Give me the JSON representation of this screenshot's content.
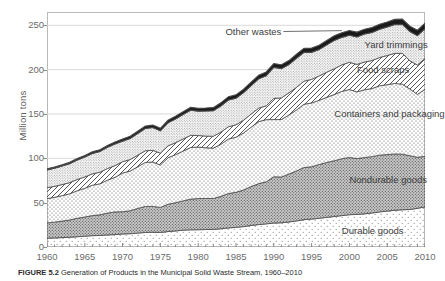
{
  "figure": {
    "caption_label": "FIGURE 5.2",
    "caption_text": "Generation of Products in the Municipal Solid Waste Stream, 1960–2010"
  },
  "chart_data": {
    "type": "area",
    "stacked": true,
    "title": "",
    "xlabel": "",
    "ylabel": "Million tons",
    "xlim": [
      1960,
      2010
    ],
    "ylim": [
      0,
      265
    ],
    "yticks": [
      0,
      50,
      100,
      150,
      200,
      250
    ],
    "xticks": [
      1960,
      1965,
      1970,
      1975,
      1980,
      1985,
      1990,
      1995,
      2000,
      2005,
      2010
    ],
    "grid": "horizontal",
    "legend_position": "in-plot-labels",
    "x": [
      1960,
      1961,
      1962,
      1963,
      1964,
      1965,
      1966,
      1967,
      1968,
      1969,
      1970,
      1971,
      1972,
      1973,
      1974,
      1975,
      1976,
      1977,
      1978,
      1979,
      1980,
      1981,
      1982,
      1983,
      1984,
      1985,
      1986,
      1987,
      1988,
      1989,
      1990,
      1991,
      1992,
      1993,
      1994,
      1995,
      1996,
      1997,
      1998,
      1999,
      2000,
      2001,
      2002,
      2003,
      2004,
      2005,
      2006,
      2007,
      2008,
      2009,
      2010
    ],
    "series": [
      {
        "name": "Durable goods",
        "pattern": "sparse-dots",
        "color": "#ffffff",
        "label_x_year": 1999,
        "label_y_value": 18,
        "values": [
          9.9,
          10.2,
          10.6,
          11.0,
          11.6,
          12.2,
          12.8,
          13.0,
          13.6,
          14.0,
          14.7,
          15.0,
          15.7,
          16.4,
          16.6,
          16.4,
          17.4,
          18.1,
          19.0,
          19.4,
          19.5,
          19.7,
          19.8,
          20.6,
          21.5,
          22.2,
          23.0,
          24.2,
          25.3,
          26.1,
          27.0,
          27.3,
          28.2,
          29.4,
          30.8,
          31.5,
          32.4,
          33.4,
          34.4,
          35.4,
          36.4,
          36.8,
          37.4,
          38.4,
          39.6,
          40.5,
          41.4,
          42.0,
          42.3,
          43.6,
          45.3
        ]
      },
      {
        "name": "Nondurable goods",
        "pattern": "dense-dots-gray",
        "color": "#cfcfcf",
        "label_x_year": 2000,
        "label_y_value": 76,
        "values": [
          17.3,
          17.8,
          18.6,
          19.4,
          20.8,
          21.6,
          22.6,
          23.3,
          24.6,
          25.6,
          25.1,
          25.9,
          27.8,
          29.3,
          29.2,
          28.2,
          30.8,
          31.8,
          33.0,
          34.6,
          35.1,
          35.0,
          34.9,
          36.5,
          38.8,
          39.5,
          41.3,
          43.9,
          46.2,
          47.4,
          52.2,
          51.6,
          54.1,
          56.4,
          58.8,
          59.0,
          60.6,
          61.9,
          62.9,
          64.1,
          64.6,
          62.9,
          63.5,
          63.5,
          64.0,
          63.7,
          63.5,
          62.7,
          60.6,
          57.6,
          56.9
        ]
      },
      {
        "name": "Containers and packaging",
        "pattern": "medium-dots",
        "color": "#ffffff",
        "label_x_year": 1998,
        "label_y_value": 150,
        "values": [
          27.4,
          28.0,
          28.7,
          29.6,
          31.1,
          32.4,
          34.2,
          35.0,
          37.2,
          39.0,
          43.6,
          44.8,
          47.0,
          49.7,
          50.0,
          47.9,
          52.4,
          54.2,
          56.2,
          58.2,
          58.1,
          57.2,
          56.8,
          58.8,
          61.5,
          62.1,
          64.3,
          67.0,
          69.9,
          70.1,
          64.5,
          64.8,
          66.6,
          68.7,
          71.4,
          71.9,
          72.4,
          73.5,
          74.6,
          76.0,
          76.6,
          75.2,
          76.4,
          76.8,
          78.2,
          78.8,
          79.6,
          78.9,
          75.3,
          70.9,
          75.7
        ]
      },
      {
        "name": "Food scraps",
        "pattern": "diagonal-hatch",
        "color": "#ffffff",
        "label_x_year": 2001,
        "label_y_value": 200,
        "values": [
          12.2,
          12.4,
          12.5,
          12.6,
          12.7,
          12.8,
          12.9,
          13.0,
          13.1,
          13.2,
          12.8,
          12.9,
          13.0,
          13.1,
          13.2,
          13.3,
          13.4,
          13.5,
          13.6,
          13.7,
          13.0,
          13.2,
          13.4,
          13.6,
          13.8,
          14.0,
          14.4,
          14.8,
          15.2,
          15.6,
          23.9,
          24.4,
          25.0,
          25.5,
          26.0,
          26.6,
          27.5,
          28.3,
          29.1,
          29.9,
          30.7,
          31.0,
          31.3,
          31.6,
          31.9,
          32.9,
          33.9,
          34.8,
          31.8,
          33.0,
          34.8
        ]
      },
      {
        "name": "Yard trimmings",
        "pattern": "fine-dots",
        "color": "#ffffff",
        "label_x_year": 2002,
        "label_y_value": 228,
        "values": [
          20.0,
          20.4,
          20.9,
          21.4,
          21.9,
          22.4,
          22.9,
          23.4,
          23.9,
          24.4,
          23.2,
          23.8,
          24.5,
          25.2,
          25.8,
          25.2,
          26.0,
          26.8,
          27.6,
          28.4,
          27.5,
          28.2,
          28.8,
          29.5,
          30.2,
          30.0,
          31.0,
          32.0,
          33.0,
          34.0,
          35.0,
          33.0,
          31.8,
          32.8,
          32.5,
          30.5,
          29.8,
          30.8,
          32.0,
          31.0,
          30.5,
          31.0,
          31.5,
          31.6,
          31.8,
          32.1,
          32.4,
          32.6,
          32.9,
          33.2,
          33.4
        ]
      },
      {
        "name": "Other wastes",
        "pattern": "solid-black",
        "color": "#1a1a1a",
        "label_x_year": 1991,
        "label_y_value": 243,
        "values": [
          1.3,
          1.4,
          1.5,
          1.6,
          1.7,
          1.8,
          1.9,
          2.0,
          2.1,
          2.2,
          2.3,
          2.4,
          2.5,
          2.6,
          2.7,
          2.8,
          2.9,
          3.0,
          3.1,
          3.2,
          3.3,
          3.4,
          3.5,
          3.6,
          3.7,
          3.8,
          3.9,
          4.0,
          4.1,
          4.2,
          4.3,
          4.4,
          4.5,
          4.6,
          4.7,
          4.8,
          4.9,
          5.0,
          5.1,
          5.2,
          5.3,
          5.4,
          5.5,
          5.6,
          5.7,
          5.8,
          5.9,
          6.0,
          6.1,
          6.2,
          6.3
        ]
      }
    ],
    "totals": [
      88.1,
      90.2,
      92.8,
      95.6,
      99.8,
      103.2,
      107.3,
      109.7,
      114.5,
      118.4,
      121.7,
      124.8,
      130.5,
      136.3,
      137.5,
      133.8,
      142.9,
      147.4,
      152.5,
      157.5,
      156.5,
      156.7,
      157.2,
      162.6,
      169.5,
      171.6,
      177.9,
      185.9,
      193.7,
      197.4,
      206.9,
      205.5,
      210.2,
      217.4,
      224.2,
      224.3,
      227.6,
      232.9,
      238.1,
      241.6,
      244.1,
      242.3,
      245.6,
      247.5,
      251.2,
      253.8,
      256.7,
      257.0,
      249.0,
      244.5,
      252.4
    ]
  },
  "axis_labels": {
    "y_title": "Million tons",
    "y_ticks": [
      "0",
      "50",
      "100",
      "150",
      "200",
      "250"
    ],
    "x_ticks": [
      "1960",
      "1965",
      "1970",
      "1975",
      "1980",
      "1985",
      "1990",
      "1995",
      "2000",
      "2005",
      "2010"
    ]
  },
  "series_labels": [
    {
      "name": "other-wastes",
      "text": "Other wastes"
    },
    {
      "name": "yard-trimmings",
      "text": "Yard trimmings"
    },
    {
      "name": "food-scraps",
      "text": "Food scraps"
    },
    {
      "name": "containers-and-packaging",
      "text": "Containers and packaging"
    },
    {
      "name": "nondurable-goods",
      "text": "Nondurable goods"
    },
    {
      "name": "durable-goods",
      "text": "Durable goods"
    }
  ]
}
